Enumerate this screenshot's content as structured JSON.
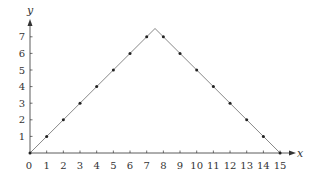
{
  "chart_data": {
    "type": "line",
    "title": "",
    "xlabel": "x",
    "ylabel": "y",
    "xlim": [
      0,
      15
    ],
    "ylim": [
      0,
      7.5
    ],
    "grid": false,
    "legend": null,
    "line": {
      "name": "tent function",
      "x": [
        0,
        7.5,
        15
      ],
      "y": [
        0,
        7.5,
        0
      ]
    },
    "points": {
      "name": "integer points",
      "x": [
        0,
        1,
        2,
        3,
        4,
        5,
        6,
        7,
        8,
        9,
        10,
        11,
        12,
        13,
        14,
        15
      ],
      "y": [
        0,
        1,
        2,
        3,
        4,
        5,
        6,
        7,
        7,
        6,
        5,
        4,
        3,
        2,
        1,
        0
      ]
    },
    "x_ticks": [
      "0",
      "1",
      "2",
      "3",
      "4",
      "5",
      "6",
      "7",
      "8",
      "9",
      "10",
      "11",
      "12",
      "13",
      "14",
      "15"
    ],
    "y_ticks": [
      "1",
      "2",
      "3",
      "4",
      "5",
      "6",
      "7"
    ]
  },
  "colors": {
    "axis": "#333333",
    "line": "#888888",
    "point": "#222222"
  }
}
